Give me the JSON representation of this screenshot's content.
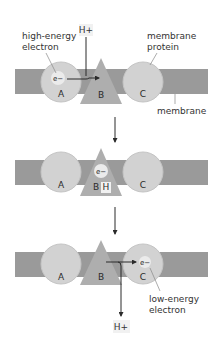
{
  "diagram": {
    "colors": {
      "membrane": "#9a9a9a",
      "protein_circle": "#d2d2d2",
      "protein_circle_edge": "#c4c4c4",
      "triangle_B": "#aeaeae",
      "electron_high": "#ebebeb",
      "electron_low": "#ebebeb",
      "arrow": "#2b2b2b",
      "proton_box": "#f1f1f1",
      "leader_line": "#888888"
    },
    "panels": [
      {
        "step": 1,
        "labels": {
          "high_energy_electron_line1": "high-energy",
          "high_energy_electron_line2": "electron",
          "membrane_protein_line1": "membrane",
          "membrane_protein_line2": "protein",
          "membrane": "membrane",
          "proton_in": "H+",
          "electron": "e−",
          "protein_A": "A",
          "protein_B": "B",
          "protein_C": "C"
        }
      },
      {
        "step": 2,
        "labels": {
          "electron": "e−",
          "protein_A": "A",
          "protein_B": "B",
          "bound_proton": "H",
          "protein_C": "C"
        }
      },
      {
        "step": 3,
        "labels": {
          "low_energy_electron_line1": "low-energy",
          "low_energy_electron_line2": "electron",
          "proton_out": "H+",
          "electron": "e−",
          "protein_A": "A",
          "protein_B": "B",
          "protein_C": "C"
        }
      }
    ],
    "transitions": [
      "step 1 → step 2",
      "step 2 → step 3"
    ]
  }
}
